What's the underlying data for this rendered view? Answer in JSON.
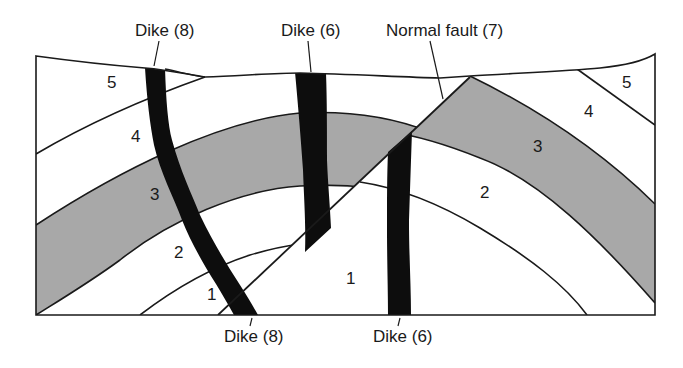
{
  "figure": {
    "type": "geologic cross-section",
    "colors": {
      "background": "#ffffff",
      "line": "#1a1a1a",
      "shaded_layer": "#a8a8a8",
      "dike": "#0d0d0d"
    }
  },
  "callouts": {
    "dike8_top": "Dike (8)",
    "dike6_top": "Dike (6)",
    "fault_top": "Normal fault (7)",
    "dike8_bottom": "Dike (8)",
    "dike6_bottom": "Dike (6)"
  },
  "units": {
    "left_5": "5",
    "left_4": "4",
    "left_3": "3",
    "left_2": "2",
    "left_1": "1",
    "center_1": "1",
    "right_2": "2",
    "right_3": "3",
    "right_4": "4",
    "right_5": "5"
  },
  "features": [
    {
      "id": "dike-8",
      "label": "Dike (8)",
      "kind": "dike"
    },
    {
      "id": "dike-6",
      "label": "Dike (6)",
      "kind": "dike",
      "offset_by": "Normal fault (7)"
    },
    {
      "id": "fault-7",
      "label": "Normal fault (7)",
      "kind": "normal fault"
    }
  ],
  "layers": [
    "1",
    "2",
    "3",
    "4",
    "5"
  ],
  "shaded_layer": "3"
}
